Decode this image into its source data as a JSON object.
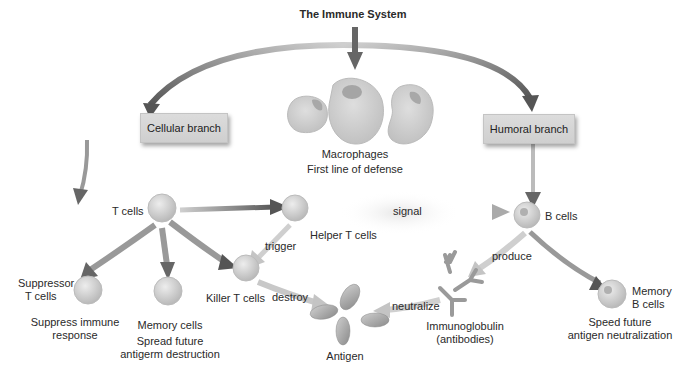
{
  "title": "The Immune System",
  "branches": {
    "cellular": "Cellular branch",
    "humoral": "Humoral branch"
  },
  "macrophages": {
    "label": "Macrophages",
    "caption": "First line of defense"
  },
  "cells": {
    "t_cells": "T cells",
    "helper_t": "Helper T cells",
    "b_cells": "B cells",
    "suppressor_t": [
      "Suppressor",
      "T cells"
    ],
    "suppressor_caption": [
      "Suppress immune",
      "response"
    ],
    "memory": "Memory cells",
    "memory_caption": [
      "Spread future",
      "antigerm destruction"
    ],
    "killer_t": "Killer T cells",
    "memory_b": [
      "Memory",
      "B cells"
    ],
    "memory_b_caption": [
      "Speed future",
      "antigen neutralization"
    ],
    "immunoglobulin": [
      "Immunoglobulin",
      "(antibodies)"
    ],
    "antigen": "Antigen"
  },
  "actions": {
    "signal": "signal",
    "trigger": "trigger",
    "destroy": "destroy",
    "produce": "produce",
    "neutralize": "neutralize"
  },
  "colors": {
    "arrow_dark": "#555555",
    "arrow_light": "#c8c8c8",
    "cell_fill": "#d9d9d9",
    "box_fill": "#d4d4d4"
  }
}
